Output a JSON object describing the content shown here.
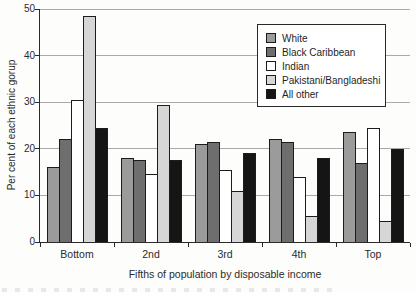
{
  "colors": {
    "white_series": "#9b9b9b",
    "black_caribbean": "#6e6e6e",
    "indian": "#ffffff",
    "pakistani_bangladeshi": "#d6d6d6",
    "all_other": "#151515",
    "bar_border": "#1c1c1c",
    "gridline": "#a9a9a9",
    "axis": "#2a2a2a",
    "text": "#2b2b2b"
  },
  "chart_data": {
    "type": "bar",
    "title": "",
    "xlabel": "Fifths of population by disposable income",
    "ylabel": "Per cent of each ethnic gorup",
    "categories": [
      "Bottom",
      "2nd",
      "3rd",
      "4th",
      "Top"
    ],
    "series": [
      {
        "name": "White",
        "color_key": "white_series",
        "values": [
          16,
          18,
          21,
          22,
          23.5
        ]
      },
      {
        "name": "Black Caribbean",
        "color_key": "black_caribbean",
        "values": [
          22,
          17.5,
          21.5,
          21.5,
          17
        ]
      },
      {
        "name": "Indian",
        "color_key": "indian",
        "values": [
          30.5,
          14.5,
          15.5,
          14,
          24.5
        ]
      },
      {
        "name": "Pakistani/Bangladeshi",
        "color_key": "pakistani_bangladeshi",
        "values": [
          48.5,
          29.5,
          11,
          5.5,
          4.5
        ]
      },
      {
        "name": "All other",
        "color_key": "all_other",
        "values": [
          24.5,
          17.5,
          19,
          18,
          20
        ]
      }
    ],
    "ylim": [
      0,
      50
    ],
    "yticks": [
      0,
      10,
      20,
      30,
      40,
      50
    ],
    "grid": true,
    "legend_position": "top-right"
  }
}
